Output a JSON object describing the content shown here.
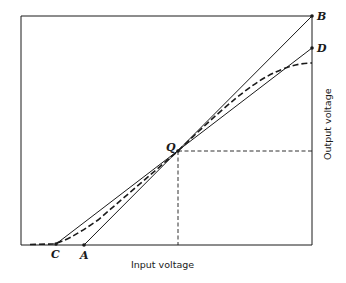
{
  "diagram": {
    "type": "transfer-characteristic",
    "x_axis_label": "Input voltage",
    "y_axis_label": "Output voltage",
    "points": {
      "B": {
        "label": "B",
        "x": 312,
        "y": 16
      },
      "D": {
        "label": "D",
        "x": 312,
        "y": 48
      },
      "Q": {
        "label": "Q",
        "x": 178,
        "y": 151
      },
      "C": {
        "label": "C",
        "x": 56,
        "y": 244
      },
      "A": {
        "label": "A",
        "x": 84,
        "y": 245
      }
    },
    "lines": [
      {
        "name": "line-A-B",
        "from": "A",
        "to": "B",
        "style": "solid"
      },
      {
        "name": "line-C-D",
        "from": "C",
        "to": "D",
        "style": "solid"
      },
      {
        "name": "q-point-vertical",
        "style": "dashed"
      },
      {
        "name": "q-point-horizontal",
        "style": "dashed"
      },
      {
        "name": "actual-characteristic-curve",
        "style": "dashed"
      }
    ],
    "colors": {
      "line": "#1a1a1a",
      "background": "#ffffff"
    }
  }
}
